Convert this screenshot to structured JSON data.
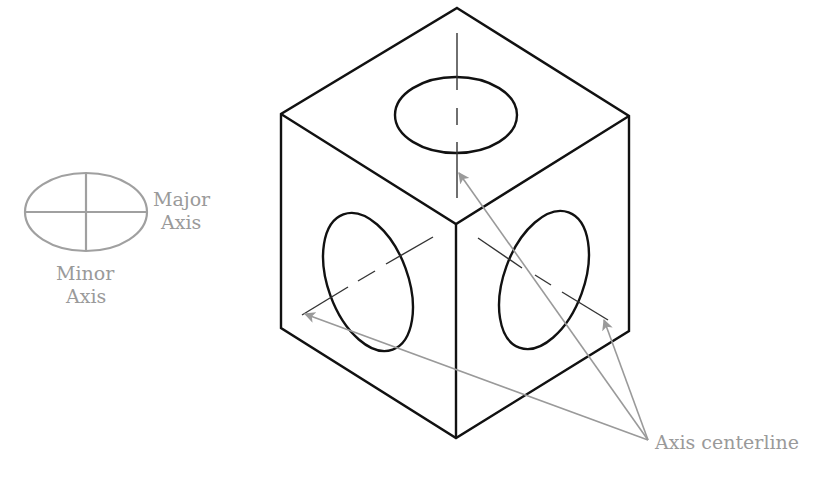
{
  "diagram": {
    "legend": {
      "major_axis_label_line1": "Major",
      "major_axis_label_line2": "Axis",
      "minor_axis_label_line1": "Minor",
      "minor_axis_label_line2": "Axis"
    },
    "callout": {
      "label": "Axis centerline",
      "arrow_count": 3
    },
    "colors": {
      "edges": "#111111",
      "centerlines": "#333333",
      "annotations": "#9a9a9a"
    }
  }
}
